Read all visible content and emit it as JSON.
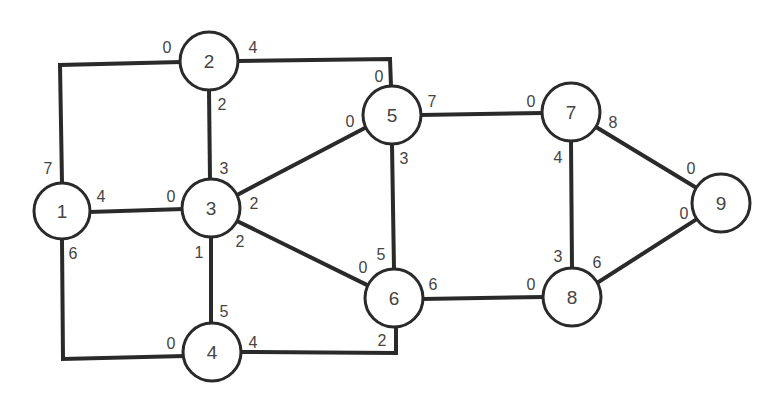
{
  "diagram": {
    "type": "weighted-graph",
    "nodes": [
      {
        "id": "1",
        "label": "1",
        "x": 62,
        "y": 211,
        "r": 28
      },
      {
        "id": "2",
        "label": "2",
        "x": 209,
        "y": 61,
        "r": 29
      },
      {
        "id": "3",
        "label": "3",
        "x": 211,
        "y": 208,
        "r": 29
      },
      {
        "id": "4",
        "label": "4",
        "x": 212,
        "y": 352,
        "r": 29
      },
      {
        "id": "5",
        "label": "5",
        "x": 392,
        "y": 115,
        "r": 29
      },
      {
        "id": "6",
        "label": "6",
        "x": 394,
        "y": 298,
        "r": 29
      },
      {
        "id": "7",
        "label": "7",
        "x": 571,
        "y": 112,
        "r": 29
      },
      {
        "id": "8",
        "label": "8",
        "x": 572,
        "y": 297,
        "r": 29
      },
      {
        "id": "9",
        "label": "9",
        "x": 721,
        "y": 203,
        "r": 29
      }
    ],
    "edges": [
      {
        "from": "1",
        "to": "2",
        "path": "M62,183 L60,65 L180,62",
        "labels": [
          {
            "text": "7",
            "x": 48,
            "y": 168
          },
          {
            "text": "0",
            "x": 167,
            "y": 47
          }
        ]
      },
      {
        "from": "1",
        "to": "3",
        "path": "M90,212 L182,209",
        "labels": [
          {
            "text": "4",
            "x": 101,
            "y": 196
          },
          {
            "text": "0",
            "x": 171,
            "y": 196
          }
        ]
      },
      {
        "from": "1",
        "to": "4",
        "path": "M62,240 L63,359 L183,356",
        "labels": [
          {
            "text": "6",
            "x": 73,
            "y": 253
          },
          {
            "text": "0",
            "x": 171,
            "y": 343
          }
        ]
      },
      {
        "from": "2",
        "to": "3",
        "path": "M209,90 L210,179",
        "labels": [
          {
            "text": "2",
            "x": 222,
            "y": 104
          },
          {
            "text": "3",
            "x": 224,
            "y": 168
          }
        ]
      },
      {
        "from": "2",
        "to": "5",
        "path": "M238,61 L390,59 L391,86",
        "labels": [
          {
            "text": "4",
            "x": 253,
            "y": 47
          },
          {
            "text": "0",
            "x": 379,
            "y": 76
          }
        ]
      },
      {
        "from": "3",
        "to": "5",
        "path": "M237,195 L365,128",
        "labels": [
          {
            "text": "2",
            "x": 254,
            "y": 203
          },
          {
            "text": "0",
            "x": 350,
            "y": 121
          }
        ]
      },
      {
        "from": "3",
        "to": "6",
        "path": "M237,221 L367,285",
        "labels": [
          {
            "text": "2",
            "x": 240,
            "y": 241
          },
          {
            "text": "0",
            "x": 363,
            "y": 267
          }
        ]
      },
      {
        "from": "3",
        "to": "4",
        "path": "M211,237 L211,323",
        "labels": [
          {
            "text": "1",
            "x": 199,
            "y": 252
          },
          {
            "text": "5",
            "x": 224,
            "y": 311
          }
        ]
      },
      {
        "from": "4",
        "to": "6",
        "path": "M241,352 L396,353 L396,327",
        "labels": [
          {
            "text": "4",
            "x": 253,
            "y": 342
          },
          {
            "text": "2",
            "x": 382,
            "y": 340
          }
        ]
      },
      {
        "from": "5",
        "to": "7",
        "path": "M421,115 L542,113",
        "labels": [
          {
            "text": "7",
            "x": 432,
            "y": 101
          },
          {
            "text": "0",
            "x": 531,
            "y": 101
          }
        ]
      },
      {
        "from": "5",
        "to": "6",
        "path": "M392,144 L394,269",
        "labels": [
          {
            "text": "3",
            "x": 404,
            "y": 158
          },
          {
            "text": "5",
            "x": 381,
            "y": 254
          }
        ]
      },
      {
        "from": "6",
        "to": "8",
        "path": "M423,299 L543,297",
        "labels": [
          {
            "text": "6",
            "x": 433,
            "y": 284
          },
          {
            "text": "0",
            "x": 531,
            "y": 284
          }
        ]
      },
      {
        "from": "7",
        "to": "8",
        "path": "M571,141 L572,268",
        "labels": [
          {
            "text": "4",
            "x": 558,
            "y": 157
          },
          {
            "text": "3",
            "x": 558,
            "y": 256
          }
        ]
      },
      {
        "from": "7",
        "to": "9",
        "path": "M596,127 L695,187",
        "labels": [
          {
            "text": "8",
            "x": 613,
            "y": 122
          },
          {
            "text": "0",
            "x": 691,
            "y": 168
          }
        ]
      },
      {
        "from": "8",
        "to": "9",
        "path": "M597,283 L697,219",
        "labels": [
          {
            "text": "6",
            "x": 597,
            "y": 262
          },
          {
            "text": "0",
            "x": 684,
            "y": 213
          }
        ]
      }
    ]
  }
}
